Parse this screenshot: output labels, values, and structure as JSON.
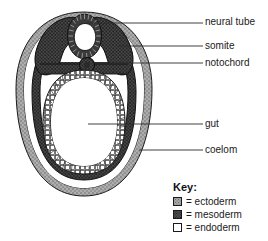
{
  "diagram": {
    "title_remnant": "a section through an embryo",
    "labels": [
      {
        "id": "neural-tube",
        "text": "neural tube"
      },
      {
        "id": "somite",
        "text": "somite"
      },
      {
        "id": "notochord",
        "text": "notochord"
      },
      {
        "id": "gut",
        "text": "gut"
      },
      {
        "id": "coelom",
        "text": "coelom"
      }
    ],
    "structures": {
      "neural_tube": "neural tube",
      "somite": "somite",
      "notochord": "notochord",
      "gut": "gut",
      "coelom": "coelom"
    }
  },
  "key": {
    "title": "Key:",
    "entries": [
      {
        "swatch": "ectoderm-swatch",
        "text": "= ectoderm",
        "color": "#a8a8a8"
      },
      {
        "swatch": "mesoderm-swatch",
        "text": "= mesoderm",
        "color": "#4d4d4d"
      },
      {
        "swatch": "endoderm-swatch",
        "text": "= endoderm",
        "color": "#ffffff"
      }
    ]
  },
  "colors": {
    "ectoderm": "#a8a8a8",
    "mesoderm": "#4d4d4d",
    "endoderm": "#ffffff",
    "outline": "#1a1a1a",
    "leader_line": "#2b2b2b",
    "background": "#ffffff"
  }
}
